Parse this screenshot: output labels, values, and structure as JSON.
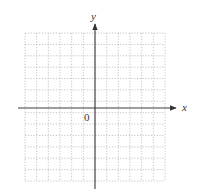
{
  "diagram": {
    "type": "coordinate-plane",
    "axes": {
      "x_label": "x",
      "y_label": "y",
      "origin_label": "0",
      "color": "#444444"
    },
    "grid": {
      "columns": 12,
      "rows": 13,
      "style": "dotted",
      "color": "#b5b5b5"
    }
  }
}
